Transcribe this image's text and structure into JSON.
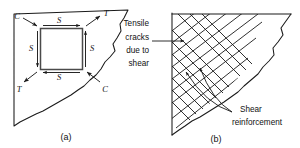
{
  "figure": {
    "background": "#ffffff",
    "ink": "#1a1a1a",
    "panels": [
      {
        "caption": "(a)",
        "stress_labels": [
          {
            "name": "shear-top",
            "text": "S"
          },
          {
            "name": "shear-left",
            "text": "S"
          },
          {
            "name": "shear-right",
            "text": "S"
          },
          {
            "name": "shear-bottom",
            "text": "S"
          }
        ],
        "principal_labels": [
          {
            "name": "compression-top-left",
            "text": "C"
          },
          {
            "name": "tension-top-right",
            "text": "T"
          },
          {
            "name": "tension-bottom-left",
            "text": "T"
          },
          {
            "name": "compression-bottom-right",
            "text": "C"
          }
        ]
      },
      {
        "caption": "(b)",
        "annotations": [
          {
            "name": "tensile-cracks-note",
            "lines": [
              "Tensile",
              "cracks",
              "due to",
              "shear"
            ]
          },
          {
            "name": "shear-reinforcement-note",
            "lines": [
              "Shear",
              "reinforcement"
            ]
          }
        ]
      }
    ]
  },
  "text": {
    "caption_a": "(a)",
    "caption_b": "(b)",
    "s_top": "S",
    "s_left": "S",
    "s_right": "S",
    "s_bottom": "S",
    "c_top_left": "C",
    "t_top_right": "T",
    "t_bottom_left": "T",
    "c_bottom_right": "C",
    "note_a_line1": "Tensile",
    "note_a_line2": "cracks",
    "note_a_line3": "due to",
    "note_a_line4": "shear",
    "note_b_line1": "Shear",
    "note_b_line2": "reinforcement"
  }
}
